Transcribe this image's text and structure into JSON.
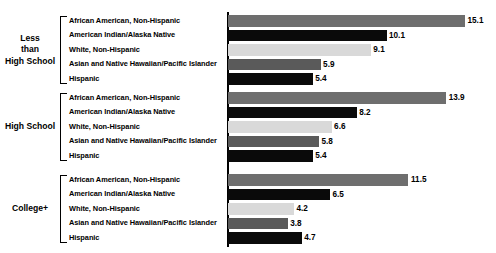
{
  "chart": {
    "title": "",
    "axis_line": "value-axis"
  },
  "chart_data": {
    "type": "bar",
    "orientation": "horizontal",
    "title": "",
    "subtitle": "",
    "xlabel": "",
    "ylabel": "",
    "xlim": [
      0,
      15.1
    ],
    "grid": false,
    "legend": "none",
    "group_label_key": "Education level",
    "categories": [
      "African American, Non-Hispanic",
      "American Indian/Alaska Native",
      "White, Non-Hispanic",
      "Asian and Native Hawaiian/Pacific Islander",
      "Hispanic"
    ],
    "groups": [
      {
        "label": "Less than High School",
        "label_lines": [
          "Less",
          "than",
          "High School"
        ],
        "values": [
          15.1,
          10.1,
          9.1,
          5.9,
          5.4
        ]
      },
      {
        "label": "High School",
        "label_lines": [
          "High School"
        ],
        "values": [
          13.9,
          8.2,
          6.6,
          5.8,
          5.4
        ]
      },
      {
        "label": "College+",
        "label_lines": [
          "College+"
        ],
        "values": [
          11.5,
          6.5,
          4.2,
          3.8,
          4.7
        ]
      }
    ],
    "series_colors": [
      "#6e6e6e",
      "#0a0a0a",
      "#d9d9d9",
      "#5a5a5a",
      "#0a0a0a"
    ],
    "value_labels": [
      [
        "15.1",
        "10.1",
        "9.1",
        "5.9",
        "5.4"
      ],
      [
        "13.9",
        "8.2",
        "6.6",
        "5.8",
        "5.4"
      ],
      [
        "11.5",
        "6.5",
        "4.2",
        "3.8",
        "4.7"
      ]
    ]
  }
}
